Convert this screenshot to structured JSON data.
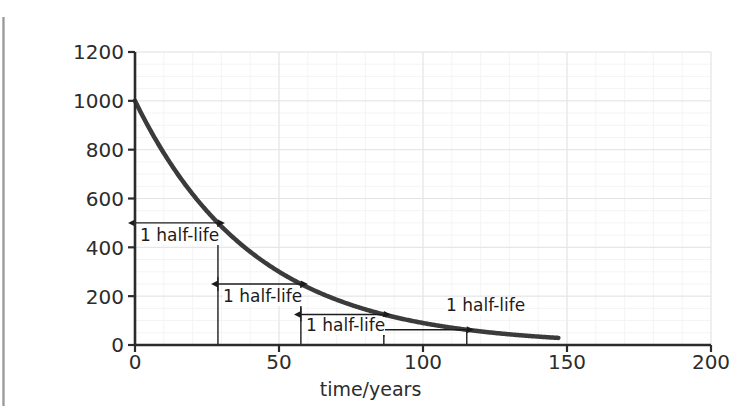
{
  "figure": {
    "background_color": "#ffffff",
    "axis_color": "#2b2b2b",
    "curve_color": "#3b3b3b",
    "grid_major_color": "#e2e2e2",
    "grid_minor_color": "#f2f2f2",
    "annotation_color": "#1c1c1c"
  },
  "chart_data": {
    "type": "line",
    "title": "",
    "subtitle": "",
    "xlabel": "time/years",
    "ylabel": "number of atoms of Sr-90 remaining",
    "xlim": [
      0,
      200
    ],
    "ylim": [
      0,
      1200
    ],
    "xticks": [
      0,
      50,
      100,
      150,
      200
    ],
    "yticks": [
      0,
      200,
      400,
      600,
      800,
      1000,
      1200
    ],
    "xtick_labels": [
      "0",
      "50",
      "100",
      "150",
      "200"
    ],
    "ytick_labels": [
      "0",
      "200",
      "400",
      "600",
      "800",
      "1000",
      "1200"
    ],
    "x_minor_step": 10,
    "y_minor_step": 50,
    "grid": true,
    "legend": false,
    "legend_position": "none",
    "series": [
      {
        "name": "Sr-90 remaining",
        "model": "exponential_decay",
        "initial_value": 1000,
        "half_life_years": 28.8,
        "x_start": 0,
        "x_end": 147,
        "x": [
          0,
          10,
          20,
          28.8,
          40,
          50,
          57.6,
          70,
          80,
          86.4,
          100,
          110,
          115.2,
          120,
          130,
          140,
          147
        ],
        "y": [
          1000,
          786,
          618,
          500,
          382,
          301,
          250,
          187,
          147,
          125,
          90,
          71,
          62.5,
          56,
          44,
          35,
          30
        ]
      }
    ],
    "annotations": [
      {
        "label": "1 half-life",
        "kind": "double-arrow",
        "y_level": 500,
        "x_from": 0,
        "x_to": 28.8,
        "text_position": "below-left"
      },
      {
        "label": "1 half-life",
        "kind": "double-arrow",
        "y_level": 250,
        "x_from": 28.8,
        "x_to": 57.6,
        "text_position": "below-left"
      },
      {
        "label": "1 half-life",
        "kind": "double-arrow",
        "y_level": 125,
        "x_from": 57.6,
        "x_to": 86.4,
        "text_position": "below-left"
      },
      {
        "label": "1 half-life",
        "kind": "double-arrow",
        "y_level": 62.5,
        "x_from": 86.4,
        "x_to": 115.2,
        "text_position": "above-right"
      }
    ],
    "dropline_x_values": [
      28.8,
      57.6,
      86.4,
      115.2
    ]
  },
  "axis": {
    "ytick_0": "0",
    "ytick_200": "200",
    "ytick_400": "400",
    "ytick_600": "600",
    "ytick_800": "800",
    "ytick_1000": "1000",
    "ytick_1200": "1200",
    "xtick_0": "0",
    "xtick_50": "50",
    "xtick_100": "100",
    "xtick_150": "150",
    "xtick_200": "200",
    "x_title": "time/years",
    "y_title": "number of atoms of Sr-90 remaining"
  },
  "annotation_labels": {
    "first": "1 half-life",
    "second": "1 half-life",
    "third": "1 half-life",
    "fourth": "1 half-life"
  }
}
